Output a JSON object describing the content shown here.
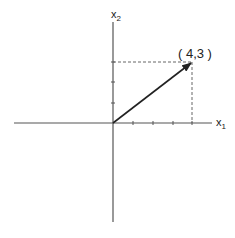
{
  "diagram": {
    "axis_labels": {
      "x1": "x",
      "x1_sub": "1",
      "x2": "x",
      "x2_sub": "2"
    },
    "vector": {
      "from": [
        0,
        0
      ],
      "to": [
        4,
        3
      ]
    },
    "point_label": "( 4,3 )",
    "colors": {
      "axis": "#444444",
      "vector": "#222222",
      "dashed": "#666666"
    }
  }
}
